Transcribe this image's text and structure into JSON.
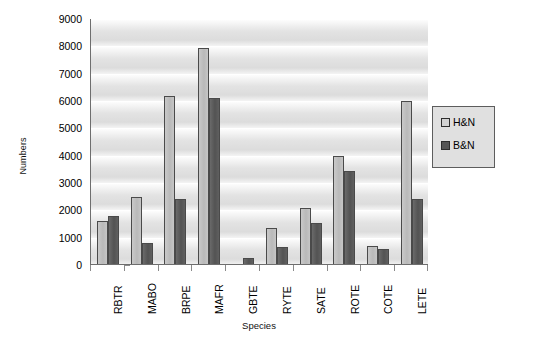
{
  "chart_data": {
    "type": "bar",
    "title": "",
    "xlabel": "Species",
    "ylabel": "Numbers",
    "ylim": [
      0,
      9000
    ],
    "ytick_step": 1000,
    "yticks": [
      "0",
      "1000",
      "2000",
      "3000",
      "4000",
      "5000",
      "6000",
      "7000",
      "8000",
      "9000"
    ],
    "grid": true,
    "legend_position": "right",
    "categories": [
      "RBTR",
      "MABO",
      "BRPE",
      "MAFR",
      "GBTE",
      "RYTE",
      "SATE",
      "ROTE",
      "COTE",
      "LETE"
    ],
    "series": [
      {
        "name": "H&N",
        "color": "#c0c0c0",
        "values": [
          1600,
          2500,
          6200,
          7950,
          0,
          1350,
          2100,
          4000,
          700,
          6000
        ]
      },
      {
        "name": "B&N",
        "color": "#595959",
        "values": [
          1800,
          800,
          2400,
          6100,
          250,
          650,
          1550,
          3450,
          600,
          2400
        ]
      }
    ]
  },
  "legend": {
    "items": [
      {
        "label": "H&N",
        "swatch": "light-gray-swatch"
      },
      {
        "label": "B&N",
        "swatch": "dark-gray-swatch"
      }
    ]
  }
}
